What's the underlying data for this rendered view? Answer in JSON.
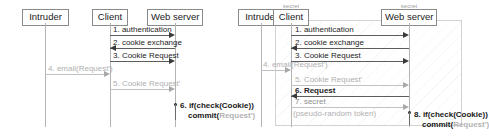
{
  "figure": {
    "kind": "uml-sequence-diagram-pair"
  },
  "left_diagram": {
    "name": "left-sequence-diagram",
    "lifelines": [
      {
        "id": "intruder",
        "label": "Intruder"
      },
      {
        "id": "client",
        "label": "Client"
      },
      {
        "id": "web-server",
        "label": "Web server"
      }
    ],
    "messages": [
      {
        "num": "1",
        "label": "1. authentication",
        "from": "client",
        "to": "web-server",
        "style": "normal"
      },
      {
        "num": "2",
        "label": "2. cookie exchange",
        "from": "web-server",
        "to": "client",
        "style": "normal"
      },
      {
        "num": "3",
        "label": "3. Cookie Request",
        "from": "client",
        "to": "web-server",
        "style": "normal"
      },
      {
        "num": "4",
        "label": "4. email(Request')",
        "from": "intruder",
        "to": "client",
        "style": "faded"
      },
      {
        "num": "5",
        "label": "5. Cookie Request'",
        "from": "client",
        "to": "web-server",
        "style": "faded"
      }
    ],
    "self_message": {
      "num": "6",
      "line1": "6. if(check(Cookie))",
      "line2_strong": "commit(",
      "line2_dim": "Request')",
      "on": "web-server"
    }
  },
  "right_diagram": {
    "name": "right-sequence-diagram",
    "lifelines": [
      {
        "id": "intruder",
        "label": "Intruder",
        "annotation": ""
      },
      {
        "id": "client",
        "label": "Client",
        "annotation": "secret"
      },
      {
        "id": "web-server",
        "label": "Web server",
        "annotation": "secret"
      }
    ],
    "messages": [
      {
        "num": "1",
        "label": "1. authentication",
        "from": "client",
        "to": "web-server",
        "style": "normal"
      },
      {
        "num": "2",
        "label": "2. cookie exchange",
        "from": "web-server",
        "to": "client",
        "style": "normal"
      },
      {
        "num": "3",
        "label": "3. Cookie Request",
        "from": "client",
        "to": "web-server",
        "style": "normal"
      },
      {
        "num": "4",
        "label": "4. email(Request')",
        "from": "intruder",
        "to": "client",
        "style": "faded"
      },
      {
        "num": "5",
        "label": "5. Cookie Request'",
        "from": "client",
        "to": "web-server",
        "style": "faded"
      },
      {
        "num": "6",
        "label": "6. Request",
        "from": "web-server",
        "to": "client",
        "style": "normal"
      },
      {
        "num": "7",
        "label": "7. secret",
        "from": "client",
        "to": "web-server",
        "style": "faded"
      }
    ],
    "note": "(pseudo-random token)",
    "self_message": {
      "num": "8",
      "line1": "8. if(check(Cookie))",
      "line2_strong": "commit(",
      "line2_dim": "Request')",
      "on": "web-server"
    }
  },
  "colors": {
    "line": "#5d5d5d",
    "lifeline": "#b4b4b4",
    "faded_text": "#b0b0b0",
    "text": "#1b1b1b",
    "box_border": "#8a8a8a",
    "region_border": "#d2d2d2"
  }
}
